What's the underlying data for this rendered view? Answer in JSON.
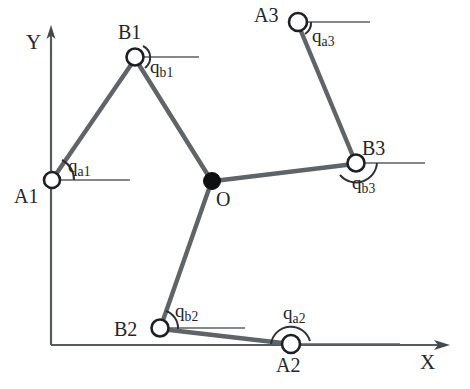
{
  "figure": {
    "type": "kinematic-diagram",
    "name": "3-RRR planar parallel manipulator",
    "background_color": "#ffffff",
    "link_color": "#5f6468",
    "joint_outline_color": "#1d2023",
    "center_joint_color": "#0e1012"
  },
  "axes": {
    "y_label": "Y",
    "x_label": "X",
    "origin": {
      "x": 51,
      "y": 345
    },
    "y_tip": {
      "x": 51,
      "y": 27
    },
    "x_tip": {
      "x": 448,
      "y": 345
    }
  },
  "center_joint": {
    "label": "O",
    "x": 212,
    "y": 181,
    "filled": true
  },
  "joints": [
    {
      "id": "A1",
      "label": "A1",
      "x": 52,
      "y": 180,
      "label_dx": -36,
      "label_dy": 8
    },
    {
      "id": "B1",
      "label": "B1",
      "x": 135,
      "y": 57,
      "label_dx": -16,
      "label_dy": -36
    },
    {
      "id": "A2",
      "label": "A2",
      "x": 291,
      "y": 344,
      "label_dx": -13,
      "label_dy": 14
    },
    {
      "id": "B2",
      "label": "B2",
      "x": 160,
      "y": 328,
      "label_dx": -45,
      "label_dy": -10
    },
    {
      "id": "A3",
      "label": "A3",
      "x": 298,
      "y": 22,
      "label_dx": -42,
      "label_dy": -12
    },
    {
      "id": "B3",
      "label": "B3",
      "x": 356,
      "y": 163,
      "label_dx": 8,
      "label_dy": -28
    }
  ],
  "links": [
    {
      "id": "A1-B1",
      "from": "A1",
      "to": "B1"
    },
    {
      "id": "B1-O",
      "from": "B1",
      "to": "O"
    },
    {
      "id": "A2-B2",
      "from": "A2",
      "to": "B2"
    },
    {
      "id": "B2-O",
      "from": "B2",
      "to": "O"
    },
    {
      "id": "A3-B3",
      "from": "A3",
      "to": "B3"
    },
    {
      "id": "B3-O",
      "from": "B3",
      "to": "O"
    }
  ],
  "angles": [
    {
      "id": "qa1",
      "base": "q",
      "sub": "a1",
      "at": "A1",
      "label_x": 68,
      "label_y": 160
    },
    {
      "id": "qb1",
      "base": "q",
      "sub": "b1",
      "at": "B1",
      "label_x": 150,
      "label_y": 60
    },
    {
      "id": "qa2",
      "base": "q",
      "sub": "a2",
      "at": "A2",
      "label_x": 283,
      "label_y": 307
    },
    {
      "id": "qb2",
      "base": "q",
      "sub": "b2",
      "at": "B2",
      "label_x": 175,
      "label_y": 305
    },
    {
      "id": "qa3",
      "base": "q",
      "sub": "a3",
      "at": "A3",
      "label_x": 312,
      "label_y": 30
    },
    {
      "id": "qb3",
      "base": "q",
      "sub": "b3",
      "at": "B3",
      "label_x": 352,
      "label_y": 177
    }
  ],
  "reference_lines": [
    {
      "id": "ref-A1",
      "x1": 52,
      "y1": 180,
      "x2": 130,
      "y2": 180
    },
    {
      "id": "ref-B1",
      "x1": 135,
      "y1": 57,
      "x2": 199,
      "y2": 57
    },
    {
      "id": "ref-A2",
      "x1": 291,
      "y1": 344,
      "x2": 400,
      "y2": 344
    },
    {
      "id": "ref-B2",
      "x1": 160,
      "y1": 328,
      "x2": 245,
      "y2": 328
    },
    {
      "id": "ref-A3",
      "x1": 298,
      "y1": 22,
      "x2": 370,
      "y2": 22
    },
    {
      "id": "ref-B3",
      "x1": 356,
      "y1": 163,
      "x2": 425,
      "y2": 163
    }
  ]
}
